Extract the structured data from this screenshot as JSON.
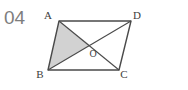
{
  "problem": {
    "number": "04"
  },
  "figure": {
    "type": "parallelogram-with-diagonals",
    "stroke_color": "#4a4a4a",
    "fill_color": "#d2d2d2",
    "label_color": "#3d3d3d",
    "background_color": "#ffffff",
    "vertices": [
      {
        "name": "A",
        "label": "A",
        "x": 59,
        "y": 21,
        "label_x": 48,
        "label_y": 19
      },
      {
        "name": "D",
        "label": "D",
        "x": 131,
        "y": 21,
        "label_x": 135,
        "label_y": 19
      },
      {
        "name": "C",
        "label": "C",
        "x": 119,
        "y": 70,
        "label_x": 122,
        "label_y": 76
      },
      {
        "name": "B",
        "label": "B",
        "x": 48,
        "y": 70,
        "label_x": 38,
        "label_y": 76
      }
    ],
    "intersection": {
      "name": "O",
      "label": "O",
      "x": 90,
      "y": 45,
      "label_x": 92,
      "label_y": 56
    },
    "shaded_region": {
      "name": "triangle-ABO",
      "vertices": [
        "A",
        "B",
        "O"
      ]
    },
    "diagonals": [
      {
        "name": "diagonal-AC",
        "from": "A",
        "to": "C"
      },
      {
        "name": "diagonal-BD",
        "from": "B",
        "to": "D"
      }
    ],
    "sides": [
      {
        "name": "side-AD",
        "from": "A",
        "to": "D"
      },
      {
        "name": "side-DC",
        "from": "D",
        "to": "C"
      },
      {
        "name": "side-CB",
        "from": "C",
        "to": "B"
      },
      {
        "name": "side-BA",
        "from": "B",
        "to": "A"
      }
    ]
  }
}
